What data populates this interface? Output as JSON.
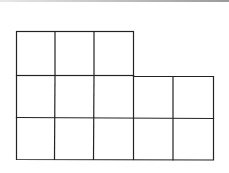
{
  "diagram": {
    "type": "grid-shape",
    "rows": [
      3,
      5,
      5
    ],
    "total_cells": 13,
    "stroke_color": "#222222",
    "background": "#ffffff"
  }
}
